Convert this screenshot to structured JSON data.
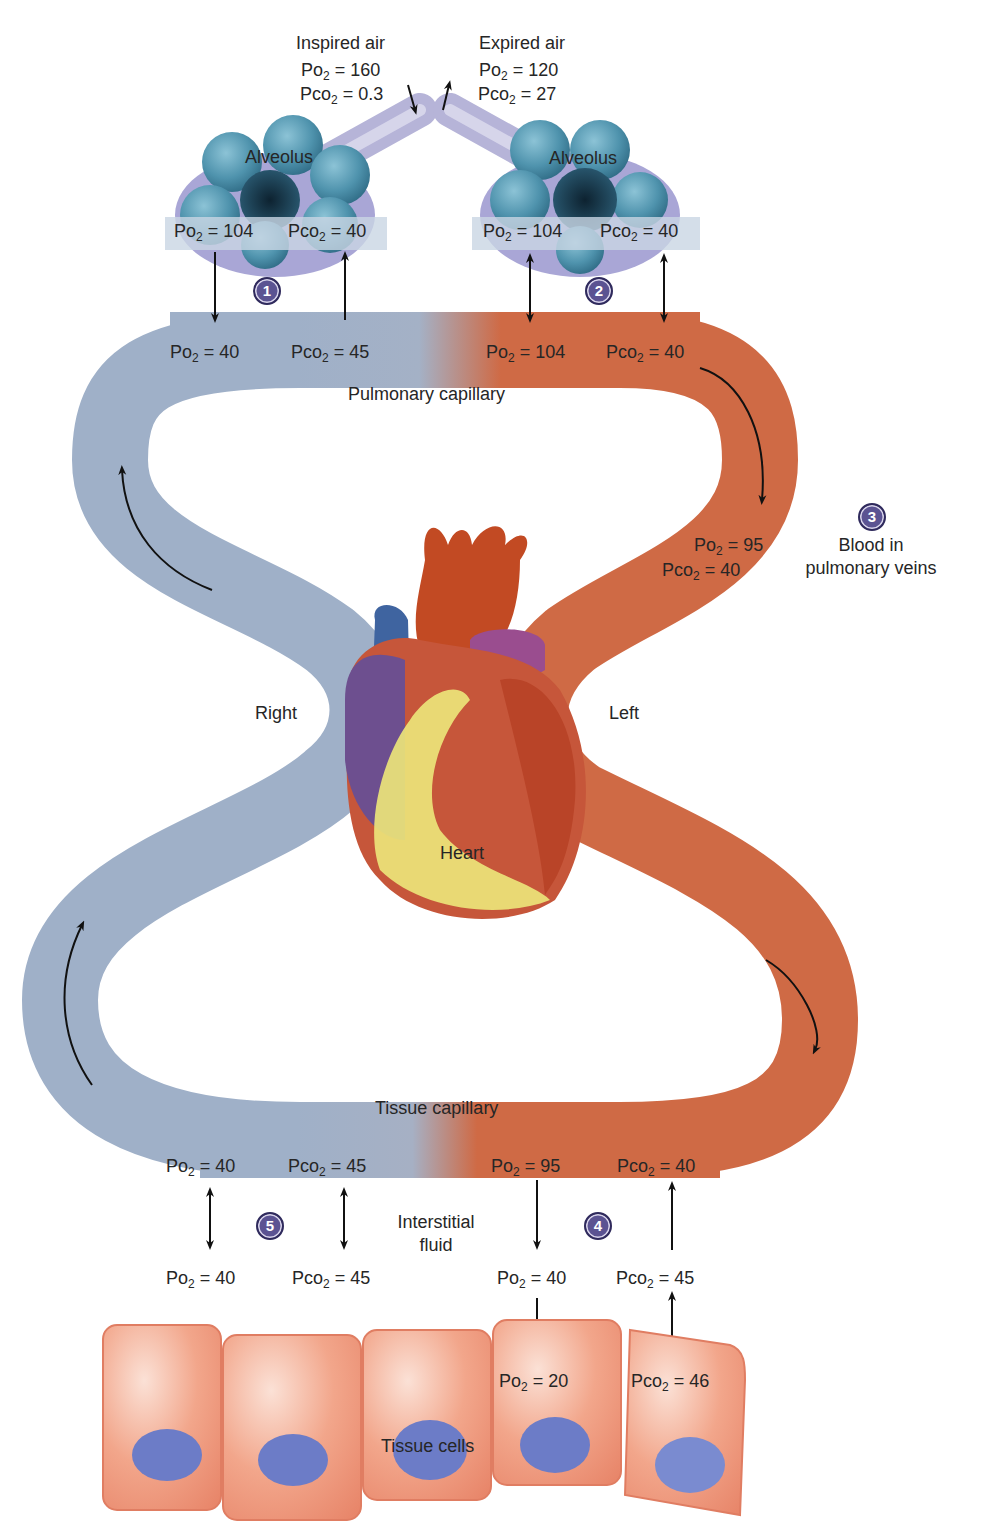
{
  "colors": {
    "deoxygenated_blood": "#9fb0c8",
    "oxygenated_blood": "#cf6a45",
    "badge": "#5b5392",
    "alveolus": "#4f93ad",
    "tissue_cell": "#f1a287",
    "nucleus": "#6c7cc7",
    "text": "#262626"
  },
  "air": {
    "inspired": {
      "title": "Inspired air",
      "po2": "160",
      "pco2": "0.3"
    },
    "expired": {
      "title": "Expired air",
      "po2": "120",
      "pco2": "27"
    }
  },
  "alveoli": [
    {
      "label": "Alveolus",
      "po2": "104",
      "pco2": "40",
      "step": "1"
    },
    {
      "label": "Alveolus",
      "po2": "104",
      "pco2": "40",
      "step": "2"
    }
  ],
  "pulmonary_capillary": {
    "label": "Pulmonary capillary",
    "venous_end": {
      "po2": "40",
      "pco2": "45"
    },
    "arterial_end": {
      "po2": "104",
      "pco2": "40"
    }
  },
  "pulmonary_veins": {
    "step": "3",
    "label_line1": "Blood in",
    "label_line2": "pulmonary veins",
    "po2": "95",
    "pco2": "40"
  },
  "heart": {
    "label": "Heart",
    "right_label": "Right",
    "left_label": "Left"
  },
  "tissue_capillary": {
    "label": "Tissue capillary",
    "venous_end": {
      "po2": "40",
      "pco2": "45"
    },
    "arterial_end": {
      "po2": "95",
      "pco2": "40"
    }
  },
  "interstitial_fluid": {
    "label_line1": "Interstitial",
    "label_line2": "fluid",
    "left": {
      "po2": "40",
      "pco2": "45",
      "step": "5"
    },
    "right": {
      "po2": "40",
      "pco2": "45",
      "step": "4"
    }
  },
  "tissue_cells": {
    "label": "Tissue cells",
    "po2": "20",
    "pco2": "46"
  },
  "symbols": {
    "po2_prefix": "Po",
    "pco2_prefix": "Pco",
    "sub": "2",
    "eq": " = "
  }
}
